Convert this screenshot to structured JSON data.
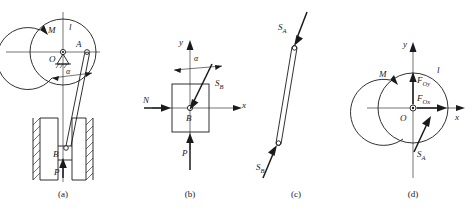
{
  "figure": {
    "width": 472,
    "height": 214,
    "line_color": "#1a1a1a",
    "background": "#ffffff"
  },
  "panels": [
    {
      "id": "a",
      "caption": "(a)",
      "description": "Wheel with applied moment M pinned at O, link AB connecting crank pin A to slider B in vertical guides loaded by force P",
      "labels": [
        {
          "name": "moment-label",
          "text": "M",
          "sub": ""
        },
        {
          "name": "radius-label",
          "text": "l",
          "sub": ""
        },
        {
          "name": "point-a-label",
          "text": "A",
          "sub": ""
        },
        {
          "name": "point-o-label",
          "text": "O",
          "sub": ""
        },
        {
          "name": "angle-label",
          "text": "α",
          "sub": ""
        },
        {
          "name": "point-b-label",
          "text": "B",
          "sub": ""
        },
        {
          "name": "force-p-label",
          "text": "P",
          "sub": ""
        }
      ]
    },
    {
      "id": "b",
      "caption": "(b)",
      "description": "Free-body diagram of slider B: axes x and y, normal reaction N, applied force P, link force S_B inclined at angle alpha from y axis",
      "labels": [
        {
          "name": "axis-y-label",
          "text": "y",
          "sub": ""
        },
        {
          "name": "axis-x-label",
          "text": "x",
          "sub": ""
        },
        {
          "name": "angle-label",
          "text": "α",
          "sub": ""
        },
        {
          "name": "force-sb-label",
          "text": "S",
          "sub": "B"
        },
        {
          "name": "force-n-label",
          "text": "N",
          "sub": ""
        },
        {
          "name": "force-p-label",
          "text": "P",
          "sub": ""
        },
        {
          "name": "point-b-label",
          "text": "B",
          "sub": ""
        }
      ]
    },
    {
      "id": "c",
      "caption": "(c)",
      "description": "Free-body diagram of two-force link AB in compression with equal opposite forces S_A at top and S_B at bottom",
      "labels": [
        {
          "name": "force-sa-label",
          "text": "S",
          "sub": "A"
        },
        {
          "name": "force-sb-label",
          "text": "S",
          "sub": "B"
        }
      ]
    },
    {
      "id": "d",
      "caption": "(d)",
      "description": "Free-body diagram of the wheel: moment M, pin reactions F_Ox and F_Oy at O, link force S_A on rim, radius l, axes x and y",
      "labels": [
        {
          "name": "moment-label",
          "text": "M",
          "sub": ""
        },
        {
          "name": "radius-label",
          "text": "l",
          "sub": ""
        },
        {
          "name": "axis-y-label",
          "text": "y",
          "sub": ""
        },
        {
          "name": "axis-x-label",
          "text": "x",
          "sub": ""
        },
        {
          "name": "point-o-label",
          "text": "O",
          "sub": ""
        },
        {
          "name": "force-foy-label",
          "text": "F",
          "sub": "Oy"
        },
        {
          "name": "force-fox-label",
          "text": "F",
          "sub": "Ox"
        },
        {
          "name": "force-sa-label",
          "text": "S",
          "sub": "A"
        }
      ]
    }
  ]
}
